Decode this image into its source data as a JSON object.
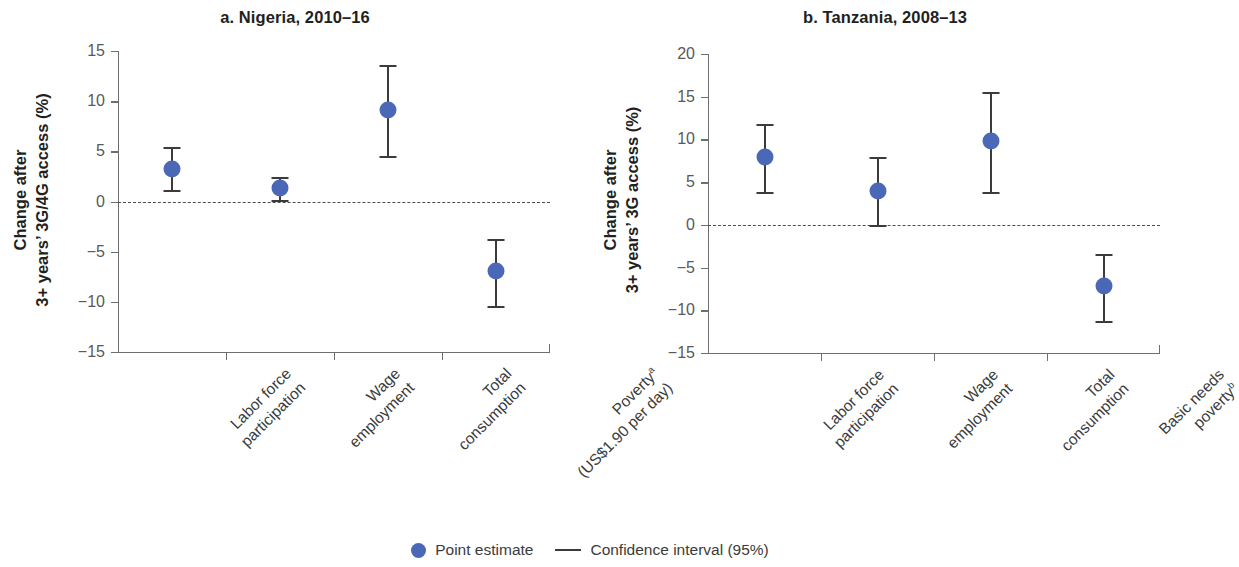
{
  "figure": {
    "legend": {
      "point_estimate_label": "Point estimate",
      "confidence_interval_label": "Confidence interval (95%)",
      "point_color": "#4a68b5",
      "line_color": "#3b3b3b"
    }
  },
  "chart_data": [
    {
      "id": "panel-a",
      "type": "scatter",
      "title": "a. Nigeria, 2010–16",
      "ylabel": "Change after\n3+ years’ 3G/4G access (%)",
      "ylabel_line1": "Change after",
      "ylabel_line2": "3+ years’ 3G/4G access (%)",
      "xlabel": "",
      "ylim": [
        -15,
        15
      ],
      "yticks": [
        15,
        10,
        5,
        0,
        -5,
        -10,
        -15
      ],
      "ytick_labels": [
        "15",
        "10",
        "5",
        "0",
        "−5",
        "−10",
        "−15"
      ],
      "grid": false,
      "zero_reference_line": 0,
      "categories": [
        "Labor force\nparticipation",
        "Wage\nemployment",
        "Total\nconsumption",
        "Povertyᵃ\n(US$1.90 per day)"
      ],
      "category_lines": [
        [
          "Labor force",
          "participation"
        ],
        [
          "Wage",
          "employment"
        ],
        [
          "Total",
          "consumption"
        ],
        [
          "Povertyª",
          "(US$1.90 per day)"
        ]
      ],
      "values": [
        3.2,
        1.3,
        9.1,
        -6.9
      ],
      "ci_low": [
        1.1,
        0.1,
        4.5,
        -10.4
      ],
      "ci_high": [
        5.4,
        2.4,
        13.6,
        -3.7
      ]
    },
    {
      "id": "panel-b",
      "type": "scatter",
      "title": "b. Tanzania, 2008–13",
      "ylabel": "Change after\n3+ years’ 3G access (%)",
      "ylabel_line1": "Change after",
      "ylabel_line2": "3+ years’ 3G access (%)",
      "xlabel": "",
      "ylim": [
        -15,
        20
      ],
      "yticks": [
        20,
        15,
        10,
        5,
        0,
        -5,
        -10,
        -15
      ],
      "ytick_labels": [
        "20",
        "15",
        "10",
        "5",
        "0",
        "−5",
        "−10",
        "−15"
      ],
      "grid": false,
      "zero_reference_line": 0,
      "categories": [
        "Labor force\nparticipation",
        "Wage\nemployment",
        "Total\nconsumption",
        "Basic needs\npovertyᵇ"
      ],
      "category_lines": [
        [
          "Labor force",
          "participation"
        ],
        [
          "Wage",
          "employment"
        ],
        [
          "Total",
          "consumption"
        ],
        [
          "Basic needs",
          "povertyᵇ"
        ]
      ],
      "values": [
        8.0,
        4.0,
        9.8,
        -7.2
      ],
      "ci_low": [
        3.8,
        0.0,
        3.9,
        -11.2
      ],
      "ci_high": [
        11.8,
        7.9,
        15.6,
        -3.4
      ]
    }
  ]
}
